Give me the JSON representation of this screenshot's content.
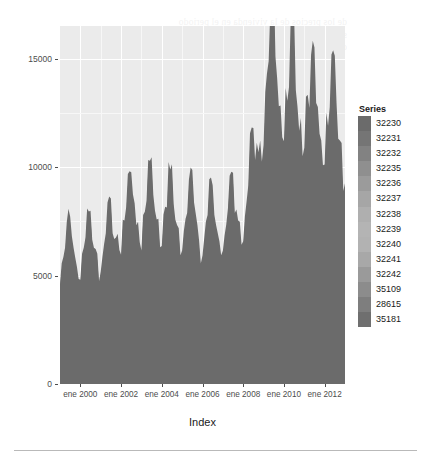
{
  "chart_data": {
    "type": "area",
    "title": "",
    "subtitle": "",
    "xlabel": "Index",
    "ylabel": "",
    "stacked": true,
    "grid": true,
    "legend_position": "right",
    "legend_title": "Series",
    "ylim": [
      0,
      16500
    ],
    "yticks": [
      0,
      5000,
      10000,
      15000
    ],
    "ytick_labels": [
      "0",
      "5000",
      "10000",
      "15000"
    ],
    "xtick_labels": [
      "ene 2000",
      "ene 2002",
      "ene 2004",
      "ene 2006",
      "ene 2008",
      "ene 2010",
      "ene 2012"
    ],
    "x_start": "ene 1999",
    "x_end": "ene 2013",
    "x_frequency": "monthly",
    "palette": [
      "#6b6b6b",
      "#757575",
      "#828282",
      "#8f8f8f",
      "#9b9b9b",
      "#a6a6a6",
      "#afafaf",
      "#b4b4b4",
      "#b2b2b2",
      "#a8a8a8",
      "#9a9a9a",
      "#8c8c8c",
      "#7e7e7e",
      "#6f6f6f"
    ],
    "series": [
      {
        "name": "32230",
        "color": "#6b6b6b",
        "values": [
          420,
          430,
          445,
          460,
          470,
          455,
          465,
          480,
          500,
          520,
          540,
          560,
          600,
          640,
          690,
          740,
          800,
          860,
          920,
          980,
          1040,
          1100,
          1160,
          1220,
          1260,
          1300,
          1340,
          1380,
          1420,
          1460,
          1500,
          1540,
          1580,
          1620,
          1650,
          1680,
          1700,
          1720,
          1740,
          1760,
          1780,
          1800,
          1820,
          1840,
          1860,
          1880,
          1900,
          1920,
          1940,
          1960,
          1980,
          2000,
          2020,
          2040,
          2060,
          2080,
          2100,
          2120,
          2140,
          2160,
          2180,
          2200,
          2220,
          2240,
          2260,
          2280,
          2300,
          2320,
          2340,
          2360,
          2380,
          2400,
          2420,
          2440,
          2460,
          2480,
          2500,
          2520,
          2540,
          2560,
          2580,
          2600,
          2620,
          2640,
          2660,
          2680,
          2700,
          2720,
          2740,
          2760,
          2780,
          2800,
          2820,
          2840,
          2860,
          2880,
          2900,
          2920,
          2940,
          2960,
          2980,
          3000,
          3100,
          3400,
          3900,
          4300,
          4600,
          4750,
          4800,
          4820,
          4800,
          4780,
          4760,
          4740,
          4720,
          4700,
          4680,
          4660,
          4640,
          4620,
          4600,
          4580,
          4560,
          4540,
          4520,
          4500,
          4480,
          4460,
          4440,
          4420,
          4400,
          4380,
          4360,
          4340,
          4320,
          4300,
          4280,
          4260,
          4240,
          4220,
          4200,
          4180,
          4160,
          4140,
          4120,
          4100,
          4080,
          4060,
          4040,
          4020,
          4000,
          3980,
          3960,
          3940,
          3920,
          3900,
          3880,
          3860,
          3840,
          3820,
          3800,
          3780,
          3760
        ]
      },
      {
        "name": "32231",
        "color": "#757575",
        "magnitude": "medium"
      },
      {
        "name": "32232",
        "color": "#828282",
        "magnitude": "medium"
      },
      {
        "name": "32235",
        "color": "#8f8f8f",
        "magnitude": "medium"
      },
      {
        "name": "32236",
        "color": "#9b9b9b",
        "magnitude": "large"
      },
      {
        "name": "32237",
        "color": "#a6a6a6",
        "magnitude": "large"
      },
      {
        "name": "32238",
        "color": "#afafaf",
        "magnitude": "large"
      },
      {
        "name": "32239",
        "color": "#b4b4b4",
        "magnitude": "large"
      },
      {
        "name": "32240",
        "color": "#b2b2b2",
        "magnitude": "medium"
      },
      {
        "name": "32241",
        "color": "#a8a8a8",
        "magnitude": "medium"
      },
      {
        "name": "32242",
        "color": "#9a9a9a",
        "magnitude": "medium"
      },
      {
        "name": "35109",
        "color": "#8c8c8c",
        "magnitude": "small"
      },
      {
        "name": "28615",
        "color": "#7e7e7e",
        "magnitude": "small"
      },
      {
        "name": "35181",
        "color": "#6f6f6f",
        "magnitude": "small"
      }
    ],
    "total_peak": 15000,
    "total_peak_period": "2009-2010",
    "plateau_1999_2001": 6500,
    "plateau_2002_2004": 8000,
    "plateau_2005_2008": 7500,
    "plateau_2010_2012": 12500
  },
  "legend": {
    "title": "Series",
    "items": [
      {
        "label": "32230",
        "color": "#6b6b6b"
      },
      {
        "label": "32231",
        "color": "#757575"
      },
      {
        "label": "32232",
        "color": "#828282"
      },
      {
        "label": "32235",
        "color": "#8f8f8f"
      },
      {
        "label": "32236",
        "color": "#9b9b9b"
      },
      {
        "label": "32237",
        "color": "#a6a6a6"
      },
      {
        "label": "32238",
        "color": "#afafaf"
      },
      {
        "label": "32239",
        "color": "#b4b4b4"
      },
      {
        "label": "32240",
        "color": "#b2b2b2"
      },
      {
        "label": "32241",
        "color": "#a8a8a8"
      },
      {
        "label": "32242",
        "color": "#9a9a9a"
      },
      {
        "label": "35109",
        "color": "#8c8c8c"
      },
      {
        "label": "28615",
        "color": "#7e7e7e"
      },
      {
        "label": "35181",
        "color": "#6f6f6f"
      }
    ]
  },
  "axes": {
    "x_title": "Index",
    "x_labels": [
      "ene 2000",
      "ene 2002",
      "ene 2004",
      "ene 2006",
      "ene 2008",
      "ene 2010",
      "ene 2012"
    ],
    "y_labels": [
      "15000",
      "10000",
      "5000",
      "0"
    ]
  },
  "background_text": {
    "note": "faint show-through of printed text behind the figure",
    "lines": [
      "de los precios de la vivienda en el periodo",
      "se ha mantenido por encima de la media",
      "con incrementos anuales superiores al"
    ]
  }
}
